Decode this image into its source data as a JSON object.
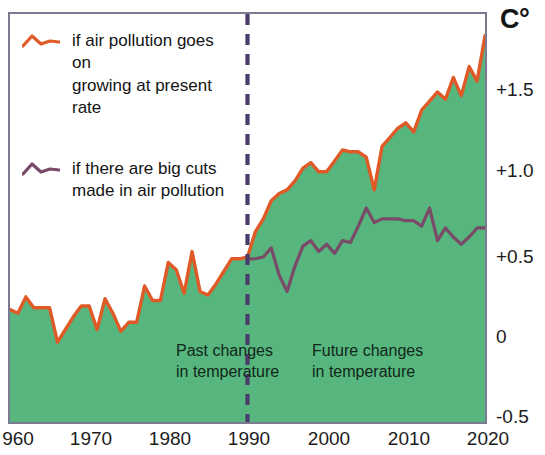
{
  "chart_data": {
    "type": "line",
    "title": "",
    "subtitle": "",
    "xlabel": "",
    "ylabel": "C°",
    "unit_label": "C°",
    "xlim": [
      1960,
      2020
    ],
    "ylim": [
      -0.5,
      1.75
    ],
    "grid": false,
    "legend_position": "top-left inside plot",
    "x_ticks": [
      "960",
      "1970",
      "1980",
      "1990",
      "2000",
      "2010",
      "2020"
    ],
    "x_tick_values": [
      1960,
      1970,
      1980,
      1990,
      2000,
      2010,
      2020
    ],
    "y_ticks": [
      "+1.5",
      "+1.0",
      "+0.5",
      "0",
      "-0.5"
    ],
    "y_tick_values": [
      1.5,
      1.0,
      0.5,
      0,
      -0.5
    ],
    "fill_color": "#56b67d",
    "divider_year": 1990,
    "divider_color": "#4a3b6b",
    "frame_color": "#7a7a92",
    "series": [
      {
        "name": "if air pollution goes on growing at present rate",
        "color": "#e05a28",
        "x": [
          1960,
          1961,
          1962,
          1963,
          1964,
          1965,
          1966,
          1967,
          1968,
          1969,
          1970,
          1971,
          1972,
          1973,
          1974,
          1975,
          1976,
          1977,
          1978,
          1979,
          1980,
          1981,
          1982,
          1983,
          1984,
          1985,
          1986,
          1987,
          1988,
          1989,
          1990,
          1991,
          1992,
          1993,
          1994,
          1995,
          1996,
          1997,
          1998,
          1999,
          2000,
          2001,
          2002,
          2003,
          2004,
          2005,
          2006,
          2007,
          2008,
          2009,
          2010,
          2011,
          2012,
          2013,
          2014,
          2015,
          2016,
          2017,
          2018,
          2019,
          2020
        ],
        "values": [
          0.12,
          0.1,
          0.19,
          0.13,
          0.13,
          0.13,
          -0.06,
          0.01,
          0.08,
          0.14,
          0.14,
          0.01,
          0.18,
          0.1,
          0.0,
          0.05,
          0.05,
          0.25,
          0.17,
          0.17,
          0.38,
          0.34,
          0.21,
          0.44,
          0.22,
          0.2,
          0.26,
          0.33,
          0.4,
          0.4,
          0.41,
          0.55,
          0.62,
          0.72,
          0.76,
          0.78,
          0.83,
          0.9,
          0.93,
          0.88,
          0.88,
          0.94,
          1.0,
          0.99,
          0.99,
          0.96,
          0.78,
          1.02,
          1.07,
          1.12,
          1.15,
          1.1,
          1.22,
          1.27,
          1.32,
          1.28,
          1.4,
          1.3,
          1.46,
          1.38,
          1.63
        ]
      },
      {
        "name": "if there are big cuts made in air pollution",
        "color": "#7a4a68",
        "x": [
          1990,
          1991,
          1992,
          1993,
          1994,
          1995,
          1996,
          1997,
          1998,
          1999,
          2000,
          2001,
          2002,
          2003,
          2004,
          2005,
          2006,
          2007,
          2008,
          2009,
          2010,
          2011,
          2012,
          2013,
          2014,
          2015,
          2016,
          2017,
          2018,
          2019,
          2020
        ],
        "values": [
          0.4,
          0.4,
          0.41,
          0.46,
          0.31,
          0.22,
          0.36,
          0.47,
          0.5,
          0.44,
          0.48,
          0.43,
          0.5,
          0.49,
          0.58,
          0.68,
          0.6,
          0.62,
          0.62,
          0.62,
          0.61,
          0.61,
          0.58,
          0.68,
          0.5,
          0.57,
          0.52,
          0.48,
          0.52,
          0.57,
          0.57
        ]
      }
    ],
    "annotations": [
      {
        "id": "past",
        "line1": "Past changes",
        "line2": "in temperature"
      },
      {
        "id": "future",
        "line1": "Future changes",
        "line2": "in temperature"
      }
    ]
  },
  "legend": {
    "items": [
      {
        "label_line1": "if air pollution goes on",
        "label_line2": "growing at present rate",
        "color": "#e05a28"
      },
      {
        "label_line1": "if there are big cuts",
        "label_line2": "made in air pollution",
        "color": "#7a4a68"
      }
    ]
  }
}
